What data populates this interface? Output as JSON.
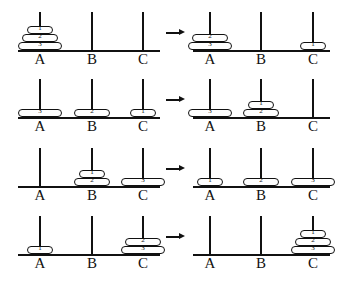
{
  "diagram": {
    "peg_labels": [
      "A",
      "B",
      "C"
    ],
    "arrow_symbol": "→",
    "disc_widths": {
      "1": 26,
      "2": 36,
      "3": 44
    },
    "steps": [
      {
        "row": 1,
        "side": "left",
        "pegs": {
          "A": [
            "3",
            "2",
            "1"
          ],
          "B": [],
          "C": []
        }
      },
      {
        "row": 1,
        "side": "right",
        "pegs": {
          "A": [
            "3",
            "2"
          ],
          "B": [],
          "C": [
            "1"
          ]
        }
      },
      {
        "row": 2,
        "side": "left",
        "pegs": {
          "A": [
            "3"
          ],
          "B": [
            "2"
          ],
          "C": [
            "1"
          ]
        }
      },
      {
        "row": 2,
        "side": "right",
        "pegs": {
          "A": [
            "3"
          ],
          "B": [
            "2",
            "1"
          ],
          "C": []
        }
      },
      {
        "row": 3,
        "side": "left",
        "pegs": {
          "A": [],
          "B": [
            "2",
            "1"
          ],
          "C": [
            "3"
          ]
        }
      },
      {
        "row": 3,
        "side": "right",
        "pegs": {
          "A": [
            "1"
          ],
          "B": [
            "2"
          ],
          "C": [
            "3"
          ]
        }
      },
      {
        "row": 4,
        "side": "left",
        "pegs": {
          "A": [
            "1"
          ],
          "B": [],
          "C": [
            "3",
            "2"
          ]
        }
      },
      {
        "row": 4,
        "side": "right",
        "pegs": {
          "A": [],
          "B": [],
          "C": [
            "3",
            "2",
            "1"
          ]
        }
      }
    ]
  }
}
